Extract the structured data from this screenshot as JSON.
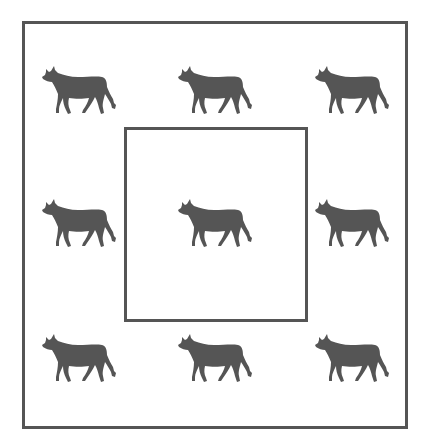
{
  "diagram": {
    "border_color": "#555555",
    "bull_color": "#555555",
    "outer_box": {
      "left": 22,
      "top": 21,
      "right": 406,
      "bottom": 427
    },
    "inner_box": {
      "left": 124,
      "top": 127,
      "right": 306,
      "bottom": 320
    },
    "bulls": [
      {
        "row": 1,
        "col": 1,
        "x": 40,
        "y": 63,
        "icon": "bull-icon"
      },
      {
        "row": 1,
        "col": 2,
        "x": 176,
        "y": 63,
        "icon": "bull-icon"
      },
      {
        "row": 1,
        "col": 3,
        "x": 313,
        "y": 63,
        "icon": "bull-icon"
      },
      {
        "row": 2,
        "col": 1,
        "x": 40,
        "y": 196,
        "icon": "bull-icon"
      },
      {
        "row": 2,
        "col": 2,
        "x": 176,
        "y": 196,
        "icon": "bull-icon",
        "enclosed": true
      },
      {
        "row": 2,
        "col": 3,
        "x": 313,
        "y": 196,
        "icon": "bull-icon"
      },
      {
        "row": 3,
        "col": 1,
        "x": 40,
        "y": 331,
        "icon": "bull-icon"
      },
      {
        "row": 3,
        "col": 2,
        "x": 176,
        "y": 331,
        "icon": "bull-icon"
      },
      {
        "row": 3,
        "col": 3,
        "x": 313,
        "y": 331,
        "icon": "bull-icon"
      }
    ]
  }
}
